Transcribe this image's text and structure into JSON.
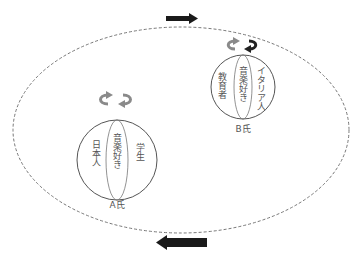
{
  "diagram": {
    "type": "identity-spheres-in-social-space",
    "colors": {
      "background": "#ffffff",
      "outline": "#555555",
      "dashed_boundary": "#777777",
      "arrow_fill": "#1a1a1a",
      "rotation_arrow_gray": "#8a8a8a",
      "rotation_arrow_dark": "#222222"
    },
    "flow_arrows": {
      "top": {
        "direction": "right"
      },
      "bottom": {
        "direction": "left"
      }
    },
    "person_a": {
      "label": "A氏",
      "left_segment": "日本人",
      "middle_segment": "音楽好き",
      "right_segment": "学生",
      "rotation_icon": "rotate-arrows-icon"
    },
    "person_b": {
      "label": "B氏",
      "left_segment": "教育者",
      "middle_segment": "音楽好き",
      "right_segment": "イタリア人",
      "rotation_icon": "rotate-arrows-icon"
    }
  }
}
